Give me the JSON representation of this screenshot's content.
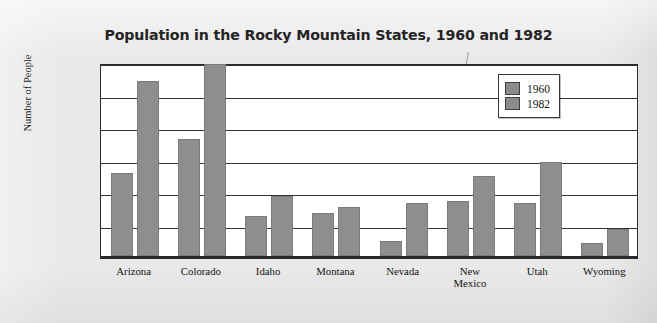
{
  "chart_data": {
    "type": "bar",
    "title": "Population in the Rocky Mountain States, 1960 and 1982",
    "xlabel": "",
    "ylabel": "Number of People",
    "ylim": [
      0,
      3000000
    ],
    "grid": true,
    "legend_position": "top-right-inside",
    "ytick_labels": [
      "0",
      "500,000",
      "1,000,000",
      "1,500,000",
      "2,000,000",
      "2,500,000",
      "3,000,000"
    ],
    "ytick_values": [
      0,
      500000,
      1000000,
      1500000,
      2000000,
      2500000,
      3000000
    ],
    "categories": [
      "Arizona",
      "Colorado",
      "Idaho",
      "Montana",
      "Nevada",
      "New\nMexico",
      "Utah",
      "Wyoming"
    ],
    "series": [
      {
        "name": "1960",
        "color": "#8e8e8e",
        "values": [
          1270000,
          1800000,
          620000,
          660000,
          230000,
          840000,
          820000,
          200000
        ]
      },
      {
        "name": "1982",
        "color": "#8e8e8e",
        "values": [
          2700000,
          2950000,
          930000,
          750000,
          810000,
          1230000,
          1440000,
          420000
        ]
      }
    ]
  },
  "legend": {
    "items": [
      {
        "label": "1960"
      },
      {
        "label": "1982"
      }
    ]
  },
  "colors": {
    "bar": "#8e8e8e",
    "plot_background": "#ffffff",
    "page_background": "#e9e9e9",
    "axis": "#2a2a2a"
  }
}
